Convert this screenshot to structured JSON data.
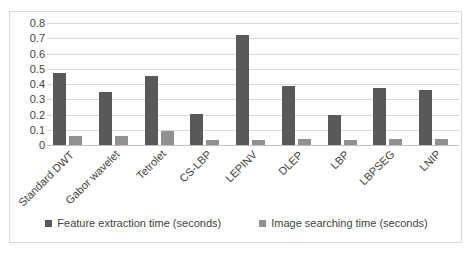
{
  "chart_data": {
    "type": "bar",
    "title": "",
    "xlabel": "",
    "ylabel": "",
    "ylim": [
      0,
      0.8
    ],
    "y_ticks": [
      "0.8",
      "0.7",
      "0.6",
      "0.5",
      "0.4",
      "0.3",
      "0.2",
      "0.1",
      "0"
    ],
    "grid": true,
    "legend_position": "bottom",
    "categories": [
      "Standard DWT",
      "Gabor wavelet",
      "Tetrolet",
      "CS-LBP",
      "LEPINV",
      "DLEP",
      "LBP",
      "LBPSEG",
      "LNIP"
    ],
    "series": [
      {
        "name": "Feature extraction time (seconds)",
        "color": "#595959",
        "values": [
          0.47,
          0.35,
          0.455,
          0.2,
          0.72,
          0.385,
          0.195,
          0.375,
          0.36
        ]
      },
      {
        "name": "Image searching time (seconds)",
        "color": "#919191",
        "values": [
          0.06,
          0.06,
          0.09,
          0.035,
          0.035,
          0.04,
          0.035,
          0.04,
          0.04
        ]
      }
    ]
  },
  "legend": {
    "items": [
      {
        "label": "Feature extraction time (seconds)"
      },
      {
        "label": "Image searching time (seconds)"
      }
    ]
  },
  "colors": {
    "series_1": "#595959",
    "series_2": "#919191",
    "gridline": "#d9d9d9",
    "frame": "#d9d9d9",
    "text": "#3f3f3f",
    "background": "#ffffff"
  }
}
